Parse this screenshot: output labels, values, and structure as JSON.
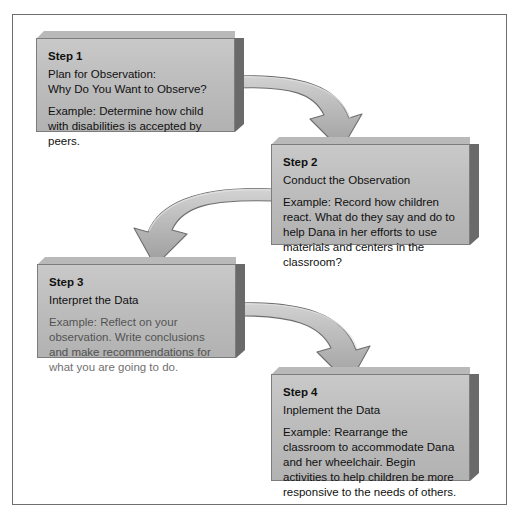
{
  "diagram": {
    "title_visible": false,
    "type": "flowchart-4-step",
    "colors": {
      "box_face": "#bdbdbd",
      "box_side": "#6a6a6a",
      "box_top_bevel": "#b9b9b9",
      "box_border": "#7d7d7d",
      "arrow_fill": "#b5b5b5",
      "arrow_stroke": "#6e6e6e",
      "frame_border": "#6e6e6e",
      "page_background": "#ffffff",
      "text": "#101010"
    },
    "steps": [
      {
        "id": "step-1",
        "title": "Step 1",
        "subtitle": "Plan for Observation:\nWhy Do You Want to Observe?",
        "example": "Example: Determine how child with disabilities is accepted by peers."
      },
      {
        "id": "step-2",
        "title": "Step 2",
        "subtitle": "Conduct the Observation",
        "example": "Example: Record how children react. What do they say and do to help Dana in her efforts to use materials and centers in the classroom?"
      },
      {
        "id": "step-3",
        "title": "Step 3",
        "subtitle": "Interpret the Data",
        "example": "Example: Reflect on your observation. Write conclusions and make recommendations for what you are going to do."
      },
      {
        "id": "step-4",
        "title": "Step 4",
        "subtitle": "Inplement the Data",
        "example": "Example: Rearrange the classroom to accommodate Dana and her wheelchair. Begin activities to help children be more responsive to the needs of others."
      }
    ],
    "connectors": [
      {
        "id": "arrow-step1-to-step2",
        "from": "step-1",
        "to": "step-2",
        "direction": "right-down"
      },
      {
        "id": "arrow-step2-to-step3",
        "from": "step-2",
        "to": "step-3",
        "direction": "left-down"
      },
      {
        "id": "arrow-step3-to-step4",
        "from": "step-3",
        "to": "step-4",
        "direction": "right-down"
      }
    ]
  }
}
